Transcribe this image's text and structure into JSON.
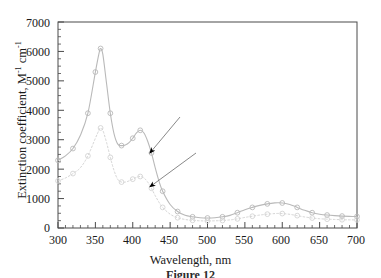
{
  "figure": {
    "caption": "Figure 12",
    "xlabel": "Wavelength, nm",
    "ylabel_main": "Extinction coefficient, M",
    "ylabel_sup1": "-1",
    "ylabel_mid": " cm",
    "ylabel_sup2": "-1"
  },
  "annotations": {
    "label_1": "1",
    "label_2": "2"
  },
  "chart_data": {
    "type": "line",
    "title": "",
    "xlabel": "Wavelength, nm",
    "ylabel": "Extinction coefficient, M-1 cm-1",
    "xlim": [
      300,
      700
    ],
    "ylim": [
      0,
      7000
    ],
    "xticks": [
      300,
      350,
      400,
      450,
      500,
      550,
      600,
      650,
      700
    ],
    "yticks": [
      0,
      1000,
      2000,
      3000,
      4000,
      5000,
      6000,
      7000
    ],
    "x_minor_tick_step": 10,
    "y_minor_tick_step": 250,
    "grid": false,
    "legend": "arrow-annotations",
    "series": [
      {
        "name": "1",
        "style": "solid-with-open-circle-markers",
        "color": "#b9b9b9",
        "x": [
          300,
          310,
          320,
          330,
          340,
          350,
          355,
          357,
          360,
          365,
          370,
          375,
          380,
          385,
          390,
          395,
          400,
          405,
          410,
          415,
          420,
          425,
          430,
          435,
          440,
          450,
          460,
          470,
          480,
          490,
          500,
          510,
          520,
          530,
          540,
          550,
          560,
          570,
          580,
          590,
          595,
          600,
          610,
          620,
          630,
          640,
          650,
          660,
          670,
          680,
          690,
          700
        ],
        "y": [
          2300,
          2450,
          2700,
          3150,
          3900,
          5300,
          5950,
          6100,
          5900,
          4900,
          3900,
          3200,
          2850,
          2800,
          2820,
          2900,
          3050,
          3230,
          3320,
          3230,
          2950,
          2550,
          2050,
          1600,
          1250,
          800,
          560,
          430,
          380,
          350,
          340,
          350,
          380,
          430,
          520,
          620,
          700,
          770,
          820,
          855,
          860,
          850,
          800,
          700,
          600,
          520,
          470,
          440,
          420,
          405,
          395,
          390
        ]
      },
      {
        "name": "2",
        "style": "dotted-with-open-circle-markers",
        "color": "#d4d4d4",
        "x": [
          300,
          310,
          320,
          330,
          340,
          350,
          355,
          357,
          360,
          365,
          370,
          375,
          380,
          385,
          390,
          395,
          400,
          405,
          410,
          415,
          420,
          425,
          430,
          435,
          440,
          450,
          460,
          470,
          480,
          490,
          500,
          510,
          520,
          530,
          540,
          550,
          560,
          570,
          580,
          590,
          595,
          600,
          610,
          620,
          630,
          640,
          650,
          660,
          670,
          680,
          690,
          700
        ],
        "y": [
          1600,
          1700,
          1850,
          2050,
          2450,
          3050,
          3330,
          3400,
          3320,
          2900,
          2400,
          1950,
          1650,
          1560,
          1560,
          1600,
          1660,
          1720,
          1750,
          1700,
          1560,
          1350,
          1100,
          880,
          700,
          470,
          350,
          290,
          260,
          245,
          240,
          245,
          255,
          275,
          310,
          360,
          400,
          440,
          470,
          490,
          495,
          490,
          465,
          420,
          375,
          340,
          315,
          300,
          290,
          282,
          277,
          275
        ]
      }
    ],
    "marker_points_series_1": [
      {
        "x": 300,
        "y": 2300
      },
      {
        "x": 320,
        "y": 2700
      },
      {
        "x": 340,
        "y": 3900
      },
      {
        "x": 350,
        "y": 5300
      },
      {
        "x": 357,
        "y": 6100
      },
      {
        "x": 370,
        "y": 3900
      },
      {
        "x": 385,
        "y": 2800
      },
      {
        "x": 400,
        "y": 3050
      },
      {
        "x": 410,
        "y": 3320
      },
      {
        "x": 425,
        "y": 2550
      },
      {
        "x": 440,
        "y": 1250
      },
      {
        "x": 460,
        "y": 560
      },
      {
        "x": 480,
        "y": 380
      },
      {
        "x": 500,
        "y": 340
      },
      {
        "x": 520,
        "y": 380
      },
      {
        "x": 540,
        "y": 520
      },
      {
        "x": 560,
        "y": 700
      },
      {
        "x": 580,
        "y": 820
      },
      {
        "x": 600,
        "y": 850
      },
      {
        "x": 620,
        "y": 700
      },
      {
        "x": 640,
        "y": 520
      },
      {
        "x": 660,
        "y": 440
      },
      {
        "x": 680,
        "y": 405
      },
      {
        "x": 700,
        "y": 390
      }
    ],
    "marker_points_series_2": [
      {
        "x": 300,
        "y": 1600
      },
      {
        "x": 320,
        "y": 1850
      },
      {
        "x": 340,
        "y": 2450
      },
      {
        "x": 357,
        "y": 3400
      },
      {
        "x": 370,
        "y": 2400
      },
      {
        "x": 385,
        "y": 1560
      },
      {
        "x": 400,
        "y": 1660
      },
      {
        "x": 410,
        "y": 1750
      },
      {
        "x": 425,
        "y": 1350
      },
      {
        "x": 440,
        "y": 700
      },
      {
        "x": 460,
        "y": 350
      },
      {
        "x": 480,
        "y": 260
      },
      {
        "x": 500,
        "y": 240
      },
      {
        "x": 520,
        "y": 255
      },
      {
        "x": 540,
        "y": 310
      },
      {
        "x": 560,
        "y": 400
      },
      {
        "x": 580,
        "y": 470
      },
      {
        "x": 600,
        "y": 490
      },
      {
        "x": 620,
        "y": 420
      },
      {
        "x": 640,
        "y": 340
      },
      {
        "x": 660,
        "y": 300
      },
      {
        "x": 680,
        "y": 282
      },
      {
        "x": 700,
        "y": 275
      }
    ],
    "annotations": [
      {
        "label": "1",
        "points_to_series": "1",
        "arrow_tip_x": 423,
        "arrow_tip_y": 2550
      },
      {
        "label": "2",
        "points_to_series": "2",
        "arrow_tip_x": 423,
        "arrow_tip_y": 1400
      }
    ]
  },
  "y_tick_labels": [
    "0",
    "1000",
    "2000",
    "3000",
    "4000",
    "5000",
    "6000",
    "7000"
  ],
  "x_tick_labels": [
    "300",
    "350",
    "400",
    "450",
    "500",
    "550",
    "600",
    "650",
    "700"
  ]
}
